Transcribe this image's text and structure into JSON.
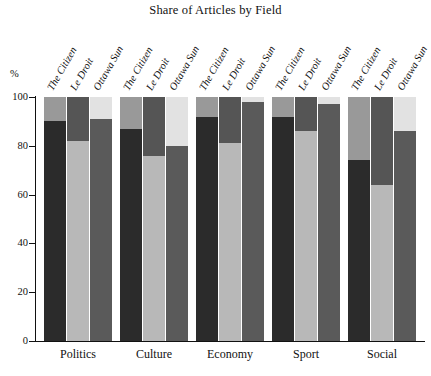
{
  "chart_data": {
    "type": "bar",
    "subtype": "stacked-100-percent-grouped",
    "title": "Share of Articles by Field",
    "xlabel": "",
    "ylabel": "%",
    "ylim": [
      0,
      100
    ],
    "yticks": [
      0,
      20,
      40,
      60,
      80,
      100
    ],
    "ytick_labels": [
      "0",
      "20",
      "40",
      "60",
      "80",
      "100"
    ],
    "grid": false,
    "legend": "none",
    "categories": [
      "Politics",
      "Culture",
      "Economy",
      "Sport",
      "Social"
    ],
    "group_members": [
      "The Citizen",
      "Le Droit",
      "Ottawa Sun"
    ],
    "segment_names": [
      "Local",
      "National",
      "International"
    ],
    "segment_colors": [
      "#2b2b2b",
      "#8f8f8f",
      "#e2e2e2"
    ],
    "bars": [
      {
        "category": "Politics",
        "members": [
          {
            "name": "The Citizen",
            "segments": [
              90,
              10,
              0
            ],
            "colors": [
              "#2b2b2b",
              "#999999",
              "#e2e2e2"
            ]
          },
          {
            "name": "Le Droit",
            "segments": [
              82,
              18,
              0
            ],
            "colors": [
              "#b8b8b8",
              "#555555",
              "#e2e2e2"
            ]
          },
          {
            "name": "Ottawa Sun",
            "segments": [
              91,
              9,
              0
            ],
            "colors": [
              "#5a5a5a",
              "#e2e2e2",
              "#e2e2e2"
            ]
          }
        ]
      },
      {
        "category": "Culture",
        "members": [
          {
            "name": "The Citizen",
            "segments": [
              87,
              13,
              0
            ],
            "colors": [
              "#2b2b2b",
              "#999999",
              "#e2e2e2"
            ]
          },
          {
            "name": "Le Droit",
            "segments": [
              76,
              24,
              0
            ],
            "colors": [
              "#b8b8b8",
              "#555555",
              "#e2e2e2"
            ]
          },
          {
            "name": "Ottawa Sun",
            "segments": [
              80,
              20,
              0
            ],
            "colors": [
              "#5a5a5a",
              "#e2e2e2",
              "#e2e2e2"
            ]
          }
        ]
      },
      {
        "category": "Economy",
        "members": [
          {
            "name": "The Citizen",
            "segments": [
              92,
              8,
              0
            ],
            "colors": [
              "#2b2b2b",
              "#999999",
              "#e2e2e2"
            ]
          },
          {
            "name": "Le Droit",
            "segments": [
              81,
              19,
              0
            ],
            "colors": [
              "#b8b8b8",
              "#555555",
              "#e2e2e2"
            ]
          },
          {
            "name": "Ottawa Sun",
            "segments": [
              98,
              2,
              0
            ],
            "colors": [
              "#5a5a5a",
              "#e2e2e2",
              "#e2e2e2"
            ]
          }
        ]
      },
      {
        "category": "Sport",
        "members": [
          {
            "name": "The Citizen",
            "segments": [
              92,
              8,
              0
            ],
            "colors": [
              "#2b2b2b",
              "#999999",
              "#e2e2e2"
            ]
          },
          {
            "name": "Le Droit",
            "segments": [
              86,
              14,
              0
            ],
            "colors": [
              "#b8b8b8",
              "#555555",
              "#e2e2e2"
            ]
          },
          {
            "name": "Ottawa Sun",
            "segments": [
              97,
              3,
              0
            ],
            "colors": [
              "#5a5a5a",
              "#e2e2e2",
              "#e2e2e2"
            ]
          }
        ]
      },
      {
        "category": "Social",
        "members": [
          {
            "name": "The Citizen",
            "segments": [
              74,
              26,
              0
            ],
            "colors": [
              "#2b2b2b",
              "#999999",
              "#e2e2e2"
            ]
          },
          {
            "name": "Le Droit",
            "segments": [
              64,
              36,
              0
            ],
            "colors": [
              "#b8b8b8",
              "#555555",
              "#e2e2e2"
            ]
          },
          {
            "name": "Ottawa Sun",
            "segments": [
              86,
              14,
              0
            ],
            "colors": [
              "#5a5a5a",
              "#e2e2e2",
              "#e2e2e2"
            ]
          }
        ]
      }
    ]
  },
  "axis": {
    "percent_symbol": "%",
    "ticks": [
      "100",
      "80",
      "60",
      "40",
      "20",
      "0"
    ]
  }
}
